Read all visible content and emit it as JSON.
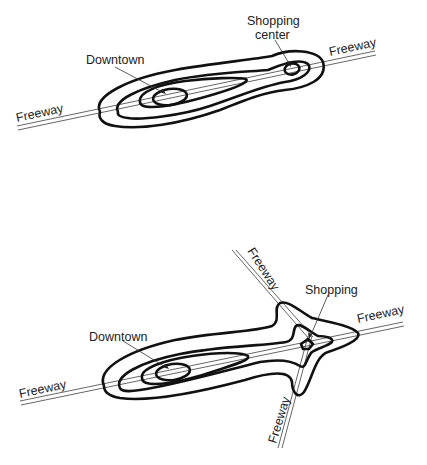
{
  "diagram_top": {
    "labels": {
      "downtown": "Downtown",
      "shopping_line1": "Shopping",
      "shopping_line2": "center",
      "freeway_left": "Freeway",
      "freeway_right": "Freeway"
    },
    "contour_count": 3,
    "centers": [
      "Downtown",
      "Shopping center"
    ]
  },
  "diagram_bottom": {
    "labels": {
      "downtown": "Downtown",
      "shopping": "Shopping",
      "freeway_left": "Freeway",
      "freeway_right": "Freeway",
      "freeway_top": "Freeway",
      "freeway_bottom": "Freeway"
    },
    "contour_count": 3,
    "centers": [
      "Downtown",
      "Shopping"
    ]
  },
  "colors": {
    "contour": "#111111",
    "road": "#555555",
    "background": "#ffffff"
  }
}
